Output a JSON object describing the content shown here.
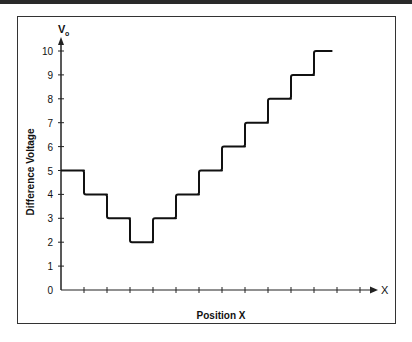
{
  "chart_data": {
    "type": "line",
    "style": "step",
    "title": "",
    "xlabel": "Position X",
    "ylabel": "Difference Voltage",
    "y_axis_symbol": "V",
    "y_axis_symbol_sub": "o",
    "x_axis_symbol": "X",
    "ylim": [
      0,
      10
    ],
    "yticks": [
      0,
      1,
      2,
      3,
      4,
      5,
      6,
      7,
      8,
      9,
      10
    ],
    "x_tick_count": 13,
    "x_tick_labels": [],
    "grid": false,
    "legend": null,
    "series": [
      {
        "name": "Difference Voltage",
        "x_segments": [
          [
            0,
            1
          ],
          [
            1,
            2
          ],
          [
            2,
            3
          ],
          [
            3,
            4
          ],
          [
            4,
            5
          ],
          [
            5,
            6
          ],
          [
            6,
            7
          ],
          [
            7,
            8
          ],
          [
            8,
            9
          ],
          [
            9,
            10
          ],
          [
            10,
            11
          ],
          [
            11,
            11.8
          ]
        ],
        "values": [
          5,
          4,
          3,
          2,
          3,
          4,
          5,
          6,
          7,
          8,
          9,
          10
        ]
      }
    ]
  }
}
